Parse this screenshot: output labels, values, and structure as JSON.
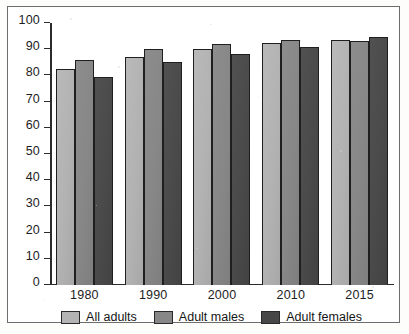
{
  "chart_data": {
    "type": "bar",
    "title": "",
    "subtitle": "",
    "xlabel": "",
    "ylabel": "",
    "categories": [
      "1980",
      "1990",
      "2000",
      "2010",
      "2015"
    ],
    "series": [
      {
        "name": "All adults",
        "color": "#b4b4b4",
        "values": [
          82.5,
          87.0,
          90.0,
          92.5,
          93.5
        ]
      },
      {
        "name": "Adult males",
        "color": "#878787",
        "values": [
          86.0,
          90.0,
          92.0,
          93.5,
          93.0
        ]
      },
      {
        "name": "Adult females",
        "color": "#474747",
        "values": [
          79.5,
          85.0,
          88.0,
          91.0,
          94.5
        ]
      }
    ],
    "ylim": [
      0,
      100
    ],
    "yticks": [
      0,
      10,
      20,
      30,
      40,
      50,
      60,
      70,
      80,
      90,
      100
    ],
    "ytick_labels": [
      "0",
      "10",
      "20",
      "30",
      "40",
      "50",
      "60",
      "70",
      "80",
      "90",
      "100"
    ],
    "grid": false,
    "legend_position": "bottom"
  },
  "legend": {
    "items": [
      {
        "label": "All adults"
      },
      {
        "label": "Adult males"
      },
      {
        "label": "Adult females"
      }
    ]
  }
}
